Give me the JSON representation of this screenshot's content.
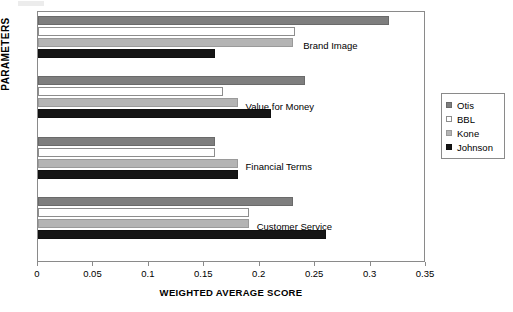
{
  "chart_data": {
    "type": "bar",
    "orientation": "horizontal",
    "title": "",
    "xlabel": "WEIGHTED AVERAGE SCORE",
    "ylabel": "PARAMETERS",
    "xlim": [
      0,
      0.35
    ],
    "xticks": [
      "0",
      "0.05",
      "0.1",
      "0.15",
      "0.2",
      "0.25",
      "0.3",
      "0.35"
    ],
    "xtick_values": [
      0,
      0.05,
      0.1,
      0.15,
      0.2,
      0.25,
      0.3,
      0.35
    ],
    "grid": false,
    "legend_position": "right",
    "categories": [
      "Brand Image",
      "Value for Money",
      "Financial Terms",
      "Customer Service"
    ],
    "series": [
      {
        "name": "Otis",
        "color": "#7e7e7e",
        "values": [
          0.317,
          0.241,
          0.16,
          0.23
        ]
      },
      {
        "name": "BBL",
        "color": "#ffffff",
        "values": [
          0.232,
          0.167,
          0.16,
          0.19
        ]
      },
      {
        "name": "Kone",
        "color": "#b4b4b4",
        "values": [
          0.23,
          0.18,
          0.18,
          0.19
        ]
      },
      {
        "name": "Johnson",
        "color": "#151515",
        "values": [
          0.16,
          0.21,
          0.18,
          0.26
        ]
      }
    ]
  },
  "legend": {
    "items": [
      {
        "label": "Otis",
        "swatch": "otis"
      },
      {
        "label": "BBL",
        "swatch": "bbl"
      },
      {
        "label": "Kone",
        "swatch": "kone"
      },
      {
        "label": "Johnson",
        "swatch": "johnson"
      }
    ]
  },
  "axes": {
    "x_title": "WEIGHTED AVERAGE SCORE",
    "y_title": "PARAMETERS"
  }
}
